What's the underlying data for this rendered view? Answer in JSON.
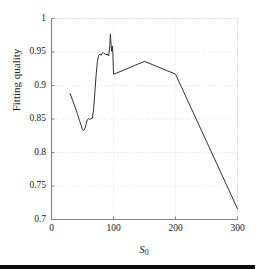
{
  "figure": {
    "background_color": "#ffffff",
    "axis_color": "#808080",
    "grid_color": "#cccccc",
    "line_color": "#333333"
  },
  "axes": {
    "y_title": "Fitting quality",
    "x_title_base": "S",
    "x_title_sub": "0",
    "y_ticks": [
      "0.7",
      "0.75",
      "0.8",
      "0.85",
      "0.9",
      "0.95",
      "1"
    ],
    "x_ticks": [
      "0",
      "100",
      "200",
      "300"
    ]
  },
  "chart_data": {
    "type": "line",
    "title": "",
    "xlabel": "S_0",
    "ylabel": "Fitting quality",
    "xlim": [
      0,
      300
    ],
    "ylim": [
      0.7,
      1.0
    ],
    "xticks": [
      0,
      100,
      200,
      300
    ],
    "yticks": [
      0.7,
      0.75,
      0.8,
      0.85,
      0.9,
      0.95,
      1.0
    ],
    "grid": true,
    "legend": "none",
    "series": [
      {
        "name": "Fitting quality",
        "color": "#333333",
        "x": [
          30,
          34,
          38,
          42,
          45,
          48,
          50,
          52,
          54,
          56,
          58,
          60,
          62,
          64,
          66,
          68,
          70,
          72,
          74,
          76,
          78,
          80,
          82,
          84,
          86,
          88,
          90,
          92,
          93,
          94,
          95,
          96,
          97,
          98,
          99,
          100,
          101,
          150,
          200,
          300
        ],
        "y": [
          0.888,
          0.878,
          0.868,
          0.857,
          0.848,
          0.84,
          0.834,
          0.833,
          0.836,
          0.843,
          0.849,
          0.851,
          0.849,
          0.851,
          0.851,
          0.866,
          0.89,
          0.916,
          0.936,
          0.945,
          0.947,
          0.945,
          0.948,
          0.949,
          0.947,
          0.946,
          0.947,
          0.944,
          0.95,
          0.96,
          0.977,
          0.962,
          0.951,
          0.959,
          0.948,
          0.917,
          0.917,
          0.936,
          0.917,
          0.716
        ]
      }
    ]
  }
}
